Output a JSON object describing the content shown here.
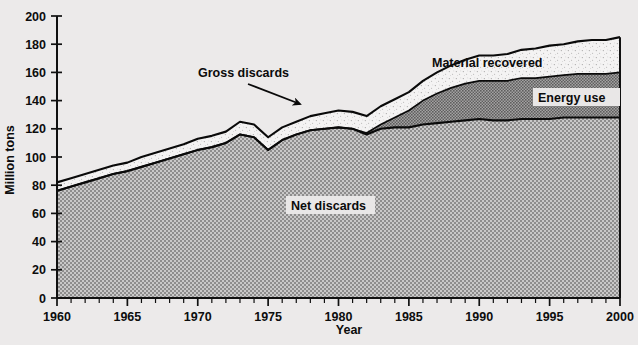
{
  "chart_data": {
    "type": "area",
    "title": "",
    "xlabel": "Year",
    "ylabel": "Million tons",
    "xlim": [
      1960,
      2000
    ],
    "ylim": [
      0,
      200
    ],
    "ytick_step": 20,
    "xtick_step": 5,
    "xminor_step": 1,
    "grid": false,
    "stacked": true,
    "legend_position": "inline-annotations",
    "x": [
      1960,
      1961,
      1962,
      1963,
      1964,
      1965,
      1966,
      1967,
      1968,
      1969,
      1970,
      1971,
      1972,
      1973,
      1974,
      1975,
      1976,
      1977,
      1978,
      1979,
      1980,
      1981,
      1982,
      1983,
      1984,
      1985,
      1986,
      1987,
      1988,
      1989,
      1990,
      1991,
      1992,
      1993,
      1994,
      1995,
      1996,
      1997,
      1998,
      1999,
      2000
    ],
    "series": [
      {
        "name": "Net discards",
        "values": [
          76,
          79,
          82,
          85,
          88,
          90,
          93,
          96,
          99,
          102,
          105,
          107,
          110,
          116,
          114,
          105,
          112,
          116,
          119,
          120,
          121,
          120,
          116,
          120,
          121,
          121,
          123,
          124,
          125,
          126,
          127,
          126,
          126,
          127,
          127,
          127,
          128,
          128,
          128,
          128,
          128
        ]
      },
      {
        "name": "Energy use",
        "values": [
          0,
          0,
          0,
          0,
          0,
          0,
          0,
          0,
          0,
          0,
          0,
          0,
          0,
          0,
          0,
          0,
          0,
          0,
          0,
          0,
          0,
          0,
          1,
          3,
          7,
          12,
          17,
          21,
          24,
          26,
          27,
          28,
          28,
          29,
          29,
          30,
          30,
          31,
          31,
          31,
          32
        ]
      },
      {
        "name": "Material recovered",
        "values": [
          6,
          6,
          6,
          6,
          6,
          6,
          7,
          7,
          7,
          7,
          8,
          8,
          8,
          9,
          9,
          9,
          9,
          9,
          10,
          11,
          12,
          12,
          12,
          13,
          13,
          13,
          14,
          15,
          16,
          17,
          18,
          18,
          19,
          20,
          21,
          22,
          22,
          23,
          24,
          24,
          25
        ]
      }
    ],
    "totals_label": "Gross discards",
    "yticks": [
      0,
      20,
      40,
      60,
      80,
      100,
      120,
      140,
      160,
      180,
      200
    ],
    "xticks": [
      1960,
      1965,
      1970,
      1975,
      1980,
      1985,
      1990,
      1995,
      2000
    ],
    "annotations": [
      {
        "name": "gross-discards",
        "text": "Gross discards",
        "kind": "arrow-label"
      },
      {
        "name": "material-recovered",
        "text": "Material recovered",
        "kind": "band-label"
      },
      {
        "name": "energy-use",
        "text": "Energy use",
        "kind": "boxed-label"
      },
      {
        "name": "net-discards",
        "text": "Net discards",
        "kind": "boxed-label"
      }
    ],
    "colors": {
      "background": "#eceaea",
      "net_discards_fill": "#a8a8a8",
      "energy_use_fill": "#8a8a8a",
      "material_recovered_fill": "#f2f1f1",
      "line": "#0a0a0a",
      "text": "#0d0d0d"
    }
  }
}
